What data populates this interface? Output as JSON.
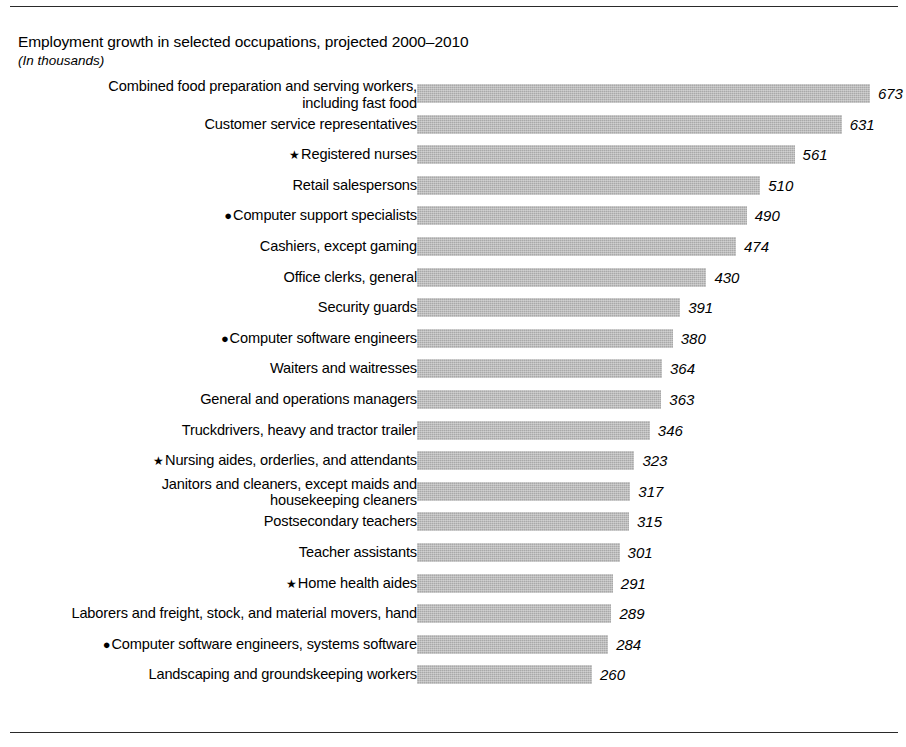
{
  "chart_data": {
    "type": "bar",
    "orientation": "horizontal",
    "title": "Employment growth in selected occupations, projected 2000–2010",
    "subtitle": "(In thousands)",
    "xlabel": "",
    "ylabel": "",
    "units": "thousands",
    "grid": false,
    "legend": null,
    "xlim": [
      0,
      673
    ],
    "categories": [
      "Combined food preparation and serving workers,\nincluding fast food",
      "Customer service representatives",
      "Registered nurses",
      "Retail salespersons",
      "Computer support specialists",
      "Cashiers, except gaming",
      "Office clerks, general",
      "Security guards",
      "Computer software engineers",
      "Waiters and waitresses",
      "General and operations managers",
      "Truckdrivers, heavy and tractor trailer",
      "Nursing aides, orderlies, and attendants",
      "Janitors and cleaners, except maids and\nhousekeeping cleaners",
      "Postsecondary teachers",
      "Teacher assistants",
      "Home health aides",
      "Laborers and freight, stock, and material movers, hand",
      "Computer software engineers, systems software",
      "Landscaping and groundskeeping workers"
    ],
    "values": [
      673,
      631,
      561,
      510,
      490,
      474,
      430,
      391,
      380,
      364,
      363,
      346,
      323,
      317,
      315,
      301,
      291,
      289,
      284,
      260
    ],
    "markers": [
      "",
      "",
      "star",
      "",
      "dot",
      "",
      "",
      "",
      "dot",
      "",
      "",
      "",
      "star",
      "",
      "",
      "",
      "star",
      "",
      "dot",
      ""
    ]
  },
  "markers": {
    "star_glyph": "★",
    "dot_glyph": "●"
  },
  "style": {
    "bar_color": "#a9a9a9",
    "rule_color": "#2a2a2a",
    "text_color": "#000000",
    "background": "#ffffff"
  }
}
